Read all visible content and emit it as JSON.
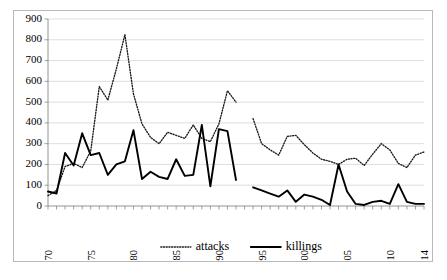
{
  "chart_data": {
    "type": "line",
    "title": "",
    "xlabel": "",
    "ylabel": "",
    "ylim": [
      0,
      900
    ],
    "ytick_step": 100,
    "yticks": [
      0,
      100,
      200,
      300,
      400,
      500,
      600,
      700,
      800,
      900
    ],
    "grid": true,
    "legend_position": "bottom",
    "xlim": [
      1970,
      2014
    ],
    "x": [
      1970,
      1971,
      1972,
      1973,
      1974,
      1975,
      1976,
      1977,
      1978,
      1979,
      1980,
      1981,
      1982,
      1983,
      1984,
      1985,
      1986,
      1987,
      1988,
      1989,
      1990,
      1991,
      1992,
      1993,
      1994,
      1995,
      1996,
      1997,
      1998,
      1999,
      2000,
      2001,
      2002,
      2003,
      2004,
      2005,
      2006,
      2007,
      2008,
      2009,
      2010,
      2011,
      2012,
      2013,
      2014
    ],
    "xtick_labels": [
      "1970",
      "1975",
      "1980",
      "1985",
      "1990",
      "1995",
      "2000",
      "2005",
      "2010",
      "2014"
    ],
    "xtick_values": [
      1970,
      1975,
      1980,
      1985,
      1990,
      1995,
      2000,
      2005,
      2010,
      2014
    ],
    "series": [
      {
        "name": "attacks",
        "style": "dotted",
        "color": "#1a1a1a",
        "values": [
          50,
          75,
          190,
          205,
          185,
          265,
          575,
          510,
          660,
          825,
          540,
          395,
          330,
          300,
          355,
          340,
          325,
          390,
          325,
          310,
          395,
          555,
          500,
          null,
          420,
          300,
          270,
          245,
          335,
          340,
          295,
          255,
          225,
          215,
          200,
          225,
          230,
          195,
          250,
          300,
          270,
          205,
          185,
          245,
          260
        ]
      },
      {
        "name": "killings",
        "style": "solid",
        "color": "#000000",
        "values": [
          70,
          60,
          255,
          195,
          350,
          245,
          255,
          150,
          200,
          215,
          365,
          130,
          165,
          140,
          130,
          225,
          145,
          150,
          390,
          95,
          370,
          360,
          125,
          null,
          90,
          75,
          60,
          45,
          75,
          20,
          55,
          45,
          30,
          5,
          200,
          70,
          10,
          5,
          20,
          25,
          10,
          105,
          20,
          10,
          10
        ]
      }
    ]
  },
  "legend": {
    "items": [
      {
        "label": "attacks",
        "marker": "dotted-line"
      },
      {
        "label": "killings",
        "marker": "solid-line"
      }
    ]
  },
  "axes": {
    "y_tick_labels": [
      "900",
      "800",
      "700",
      "600",
      "500",
      "400",
      "300",
      "200",
      "100",
      "0"
    ]
  }
}
